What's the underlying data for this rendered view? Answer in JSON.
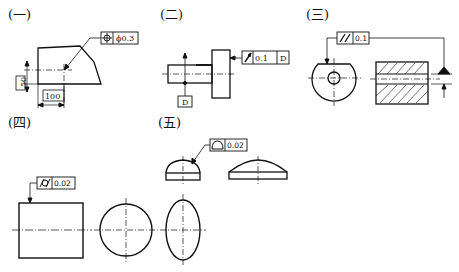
{
  "figures": [
    {
      "id": "1",
      "label": "(一)",
      "tolerance": {
        "symbol": "position-icon",
        "value": "ϕ0.3"
      },
      "dims": [
        "50",
        "100"
      ]
    },
    {
      "id": "2",
      "label": "(二)",
      "tolerance": {
        "symbol": "circular-runout-icon",
        "value": "0.1",
        "datum": "D"
      },
      "datum_label": "D"
    },
    {
      "id": "3",
      "label": "(三)",
      "tolerance": {
        "symbol": "parallelism-icon",
        "value": "0.1"
      }
    },
    {
      "id": "4",
      "label": "(四)",
      "tolerance": {
        "symbol": "cylindricity-icon",
        "value": "0.02"
      }
    },
    {
      "id": "5",
      "label": "(五)",
      "tolerance": {
        "symbol": "surface-profile-icon",
        "value": "0.02"
      }
    }
  ],
  "colors": {
    "line": "#111111",
    "background": "#ffffff"
  }
}
